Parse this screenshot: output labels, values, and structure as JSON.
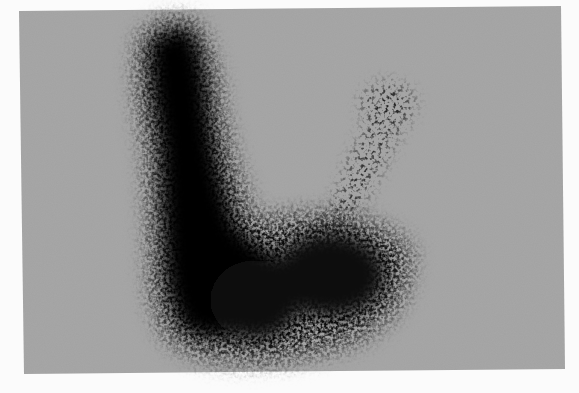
{
  "image": {
    "kind": "grayscale scintigraphy-style photograph",
    "description": "Dark speckled L/V-shaped uptake region on a uniform gray field, with a tall dense left lobe, a broad lower lobe, and a fainter diagonal arm extending up to the right",
    "colors": {
      "page_background": "#fbfbfb",
      "field_gray": "#a2a2a2",
      "blob_dark": "#0a0a0a",
      "faint_arm": "#4a4a4a"
    },
    "field_corners": {
      "top_left": [
        19,
        11
      ],
      "top_right": [
        561,
        6
      ],
      "bottom_right": [
        565,
        369
      ],
      "bottom_left": [
        24,
        374
      ]
    },
    "regions": [
      {
        "name": "left-vertical-lobe",
        "center": [
          190,
          150
        ],
        "density": "very dense"
      },
      {
        "name": "lower-left-lobe",
        "center": [
          215,
          300
        ],
        "density": "very dense"
      },
      {
        "name": "lower-right-lobe",
        "center": [
          340,
          285
        ],
        "density": "dense, speckled"
      },
      {
        "name": "upper-right-arm",
        "center": [
          365,
          150
        ],
        "density": "sparse, speckled"
      }
    ]
  }
}
